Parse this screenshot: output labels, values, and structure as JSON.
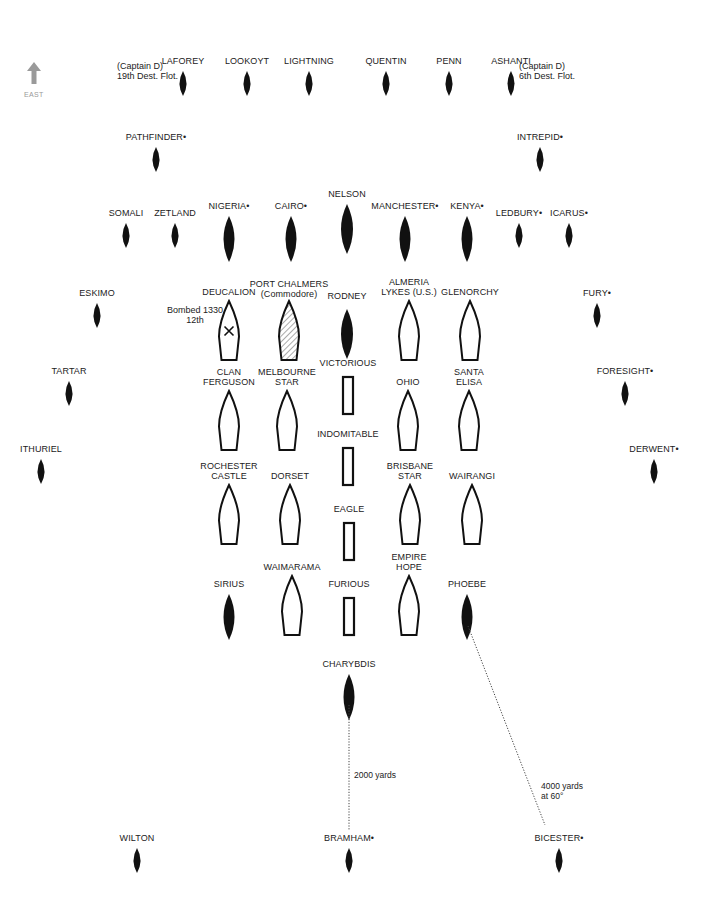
{
  "diagram": {
    "type": "naval-convoy-formation",
    "compass": {
      "label": "EAST",
      "icon": "arrow-up-icon",
      "color": "#9a9a9a"
    },
    "legend_marker": "•",
    "colors": {
      "ink": "#111111",
      "label": "#222222",
      "compass": "#9a9a9a",
      "hatch": "#555555"
    }
  },
  "ships": [
    {
      "id": "laforey",
      "label": "LAFOREY",
      "type": "destroyer",
      "x": 183,
      "y": 60,
      "note": "(Captain D)\n19th Dest. Flot.",
      "note_side": "left"
    },
    {
      "id": "lookoyt",
      "label": "LOOKOYT",
      "type": "destroyer",
      "x": 247,
      "y": 60
    },
    {
      "id": "lightning",
      "label": "LIGHTNING",
      "type": "destroyer",
      "x": 309,
      "y": 60
    },
    {
      "id": "quentin",
      "label": "QUENTIN",
      "type": "destroyer",
      "x": 386,
      "y": 60
    },
    {
      "id": "penn",
      "label": "PENN",
      "type": "destroyer",
      "x": 449,
      "y": 60
    },
    {
      "id": "ashanti",
      "label": "ASHANTI",
      "type": "destroyer",
      "x": 511,
      "y": 60,
      "note": "(Captain D)\n6th Dest. Flot.",
      "note_side": "right"
    },
    {
      "id": "pathfinder",
      "label": "PATHFINDER•",
      "type": "destroyer",
      "x": 156,
      "y": 136
    },
    {
      "id": "intrepid",
      "label": "INTREPID•",
      "type": "destroyer",
      "x": 540,
      "y": 136
    },
    {
      "id": "somali",
      "label": "SOMALI",
      "type": "destroyer",
      "x": 126,
      "y": 212
    },
    {
      "id": "zetland",
      "label": "ZETLAND",
      "type": "destroyer",
      "x": 175,
      "y": 212
    },
    {
      "id": "nigeria",
      "label": "NIGERIA•",
      "type": "cruiser",
      "x": 229,
      "y": 205
    },
    {
      "id": "cairo",
      "label": "CAIRO•",
      "type": "cruiser",
      "x": 291,
      "y": 205
    },
    {
      "id": "nelson",
      "label": "NELSON",
      "type": "battleship",
      "x": 347,
      "y": 203
    },
    {
      "id": "manchester",
      "label": "MANCHESTER•",
      "type": "cruiser",
      "x": 405,
      "y": 205
    },
    {
      "id": "kenya",
      "label": "KENYA•",
      "type": "cruiser",
      "x": 467,
      "y": 205
    },
    {
      "id": "ledbury",
      "label": "LEDBURY•",
      "type": "destroyer",
      "x": 519,
      "y": 212
    },
    {
      "id": "icarus",
      "label": "ICARUS•",
      "type": "destroyer",
      "x": 569,
      "y": 212
    },
    {
      "id": "eskimo",
      "label": "ESKIMO",
      "type": "destroyer",
      "x": 97,
      "y": 292
    },
    {
      "id": "fury",
      "label": "FURY•",
      "type": "destroyer",
      "x": 597,
      "y": 292
    },
    {
      "id": "tartar",
      "label": "TARTAR",
      "type": "destroyer",
      "x": 69,
      "y": 370
    },
    {
      "id": "foresight",
      "label": "FORESIGHT•",
      "type": "destroyer",
      "x": 625,
      "y": 370
    },
    {
      "id": "ithuriel",
      "label": "ITHURIEL",
      "type": "destroyer",
      "x": 41,
      "y": 448
    },
    {
      "id": "derwent",
      "label": "DERWENT•",
      "type": "destroyer",
      "x": 654,
      "y": 448
    },
    {
      "id": "deucalion",
      "label": "DEUCALION",
      "type": "merchant",
      "x": 229,
      "y": 300,
      "status": "bombed",
      "note": "Bombed 1330\n12th",
      "note_side": "left"
    },
    {
      "id": "port-chalmers",
      "label": "PORT CHALMERS\n(Commodore)",
      "type": "merchant",
      "x": 289,
      "y": 300,
      "status": "commodore"
    },
    {
      "id": "rodney",
      "label": "RODNEY",
      "type": "battleship",
      "x": 347,
      "y": 312
    },
    {
      "id": "almeria-lykes",
      "label": "ALMERIA\nLYKES (U.S.)",
      "type": "merchant",
      "x": 409,
      "y": 300
    },
    {
      "id": "glenorchy",
      "label": "GLENORCHY",
      "type": "merchant",
      "x": 470,
      "y": 300
    },
    {
      "id": "clan-ferguson",
      "label": "CLAN\nFERGUSON",
      "type": "merchant",
      "x": 229,
      "y": 390
    },
    {
      "id": "melbourne-star",
      "label": "MELBOURNE\nSTAR",
      "type": "merchant",
      "x": 287,
      "y": 390
    },
    {
      "id": "victorious",
      "label": "VICTORIOUS",
      "type": "carrier",
      "x": 348,
      "y": 373
    },
    {
      "id": "ohio",
      "label": "OHIO",
      "type": "merchant",
      "x": 408,
      "y": 390
    },
    {
      "id": "santa-elisa",
      "label": "SANTA\nELISA",
      "type": "merchant",
      "x": 469,
      "y": 390
    },
    {
      "id": "indomitable",
      "label": "INDOMITABLE",
      "type": "carrier",
      "x": 348,
      "y": 444
    },
    {
      "id": "rochester-castle",
      "label": "ROCHESTER\nCASTLE",
      "type": "merchant",
      "x": 229,
      "y": 484
    },
    {
      "id": "dorset",
      "label": "DORSET",
      "type": "merchant",
      "x": 290,
      "y": 484
    },
    {
      "id": "brisbane-star",
      "label": "BRISBANE\nSTAR",
      "type": "merchant",
      "x": 410,
      "y": 484
    },
    {
      "id": "wairangi",
      "label": "WAIRANGI",
      "type": "merchant",
      "x": 472,
      "y": 484
    },
    {
      "id": "eagle",
      "label": "EAGLE",
      "type": "carrier",
      "x": 349,
      "y": 519
    },
    {
      "id": "sirius",
      "label": "SIRIUS",
      "type": "cruiser",
      "x": 229,
      "y": 583
    },
    {
      "id": "waimarama",
      "label": "WAIMARAMA",
      "type": "merchant",
      "x": 292,
      "y": 575
    },
    {
      "id": "furious",
      "label": "FURIOUS",
      "type": "carrier",
      "x": 349,
      "y": 594
    },
    {
      "id": "empire-hope",
      "label": "EMPIRE\nHOPE",
      "type": "merchant",
      "x": 409,
      "y": 575
    },
    {
      "id": "phoebe",
      "label": "PHOEBE",
      "type": "cruiser",
      "x": 467,
      "y": 583
    },
    {
      "id": "charybdis",
      "label": "CHARYBDIS",
      "type": "cruiser",
      "x": 349,
      "y": 663
    },
    {
      "id": "wilton",
      "label": "WILTON",
      "type": "destroyer",
      "x": 137,
      "y": 837
    },
    {
      "id": "bramham",
      "label": "BRAMHAM•",
      "type": "destroyer",
      "x": 349,
      "y": 837
    },
    {
      "id": "bicester",
      "label": "BICESTER•",
      "type": "destroyer",
      "x": 559,
      "y": 837
    }
  ],
  "distance_lines": [
    {
      "id": "charybdis-bramham",
      "from": [
        349,
        705
      ],
      "to": [
        349,
        830
      ],
      "label": "2000 yards",
      "label_x": 354,
      "label_y": 770
    },
    {
      "id": "phoebe-bicester",
      "from": [
        468,
        626
      ],
      "to": [
        545,
        825
      ],
      "label": "4000 yards\nat 60°",
      "label_x": 541,
      "label_y": 781
    }
  ]
}
